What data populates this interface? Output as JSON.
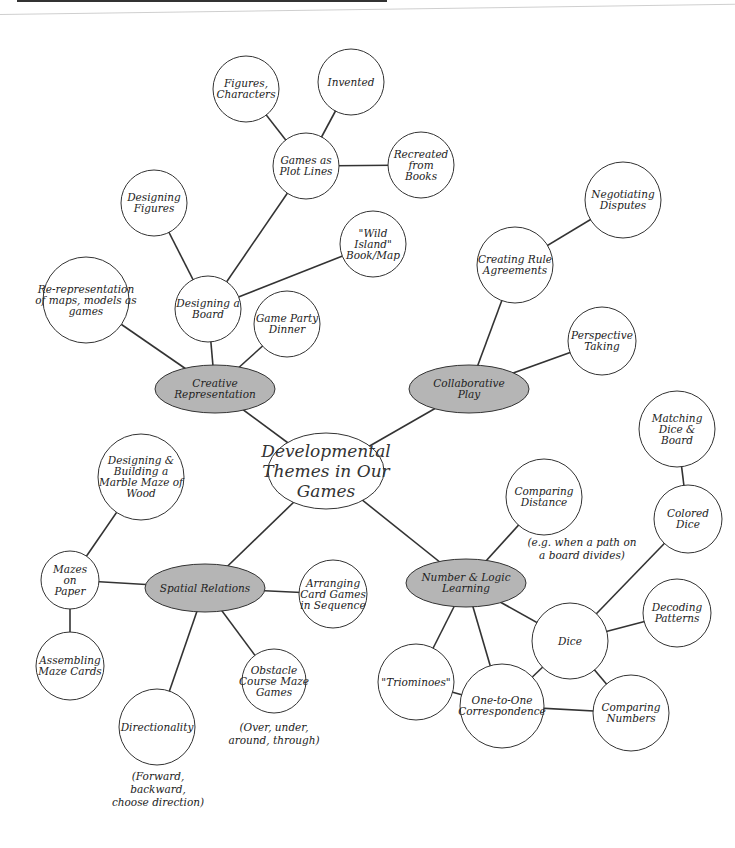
{
  "diagram": {
    "title": "Developmental Themes in Our Games",
    "colors": {
      "theme_fill": "#b5b5b5",
      "node_fill": "#ffffff",
      "stroke": "#333333"
    },
    "center": {
      "id": "center",
      "label": "Developmental\nThemes in Our\nGames",
      "x": 326,
      "y": 471,
      "rx": 58,
      "ry": 38
    },
    "themes": [
      {
        "id": "creative",
        "label": "Creative\nRepresentation",
        "x": 215,
        "y": 389,
        "rx": 60,
        "ry": 24
      },
      {
        "id": "collab",
        "label": "Collaborative\nPlay",
        "x": 469,
        "y": 389,
        "rx": 60,
        "ry": 24
      },
      {
        "id": "spatial",
        "label": "Spatial Relations",
        "x": 205,
        "y": 588,
        "rx": 60,
        "ry": 24
      },
      {
        "id": "number",
        "label": "Number & Logic\nLearning",
        "x": 466,
        "y": 583,
        "rx": 60,
        "ry": 24
      }
    ],
    "nodes": [
      {
        "id": "figures_characters",
        "label": "Figures,\nCharacters",
        "x": 246,
        "y": 89,
        "r": 33
      },
      {
        "id": "invented",
        "label": "Invented",
        "x": 351,
        "y": 82,
        "r": 33
      },
      {
        "id": "games_plot_lines",
        "label": "Games as\nPlot Lines",
        "x": 306,
        "y": 166,
        "r": 33
      },
      {
        "id": "recreated_books",
        "label": "Recreated\nfrom\nBooks",
        "x": 421,
        "y": 165,
        "r": 33
      },
      {
        "id": "designing_figures",
        "label": "Designing\nFigures",
        "x": 154,
        "y": 203,
        "r": 33
      },
      {
        "id": "wild_island",
        "label": "\"Wild\nIsland\"\nBook/Map",
        "x": 373,
        "y": 244,
        "r": 33
      },
      {
        "id": "re_representation",
        "label": "Re-representation\nof maps, models as\ngames",
        "x": 86,
        "y": 300,
        "r": 43
      },
      {
        "id": "designing_board",
        "label": "Designing a\nBoard",
        "x": 208,
        "y": 309,
        "r": 33
      },
      {
        "id": "game_party_dinner",
        "label": "Game Party\nDinner",
        "x": 287,
        "y": 324,
        "r": 33
      },
      {
        "id": "negotiating_disputes",
        "label": "Negotiating\nDisputes",
        "x": 623,
        "y": 200,
        "r": 38
      },
      {
        "id": "creating_rule_agreements",
        "label": "Creating Rule\nAgreements",
        "x": 515,
        "y": 265,
        "r": 38
      },
      {
        "id": "perspective_taking",
        "label": "Perspective\nTaking",
        "x": 602,
        "y": 341,
        "r": 34
      },
      {
        "id": "matching_dice_board",
        "label": "Matching\nDice &\nBoard",
        "x": 677,
        "y": 429,
        "r": 38
      },
      {
        "id": "colored_dice",
        "label": "Colored\nDice",
        "x": 688,
        "y": 519,
        "r": 34
      },
      {
        "id": "comparing_distance",
        "label": "Comparing\nDistance",
        "x": 544,
        "y": 497,
        "r": 38
      },
      {
        "id": "designing_building_maze",
        "label": "Designing &\nBuilding a\nMarble Maze of\nWood",
        "x": 141,
        "y": 477,
        "r": 43
      },
      {
        "id": "mazes_on_paper",
        "label": "Mazes\non\nPaper",
        "x": 70,
        "y": 580,
        "r": 29
      },
      {
        "id": "arranging_card_games",
        "label": "Arranging\nCard Games\nin Sequence",
        "x": 333,
        "y": 594,
        "r": 34
      },
      {
        "id": "assembling_maze_cards",
        "label": "Assembling\nMaze Cards",
        "x": 70,
        "y": 666,
        "r": 34
      },
      {
        "id": "obstacle_course",
        "label": "Obstacle\nCourse Maze\nGames",
        "x": 274,
        "y": 681,
        "r": 32
      },
      {
        "id": "directionality",
        "label": "Directionality",
        "x": 157,
        "y": 727,
        "r": 38
      },
      {
        "id": "triominoes",
        "label": "\"Triominoes\"",
        "x": 416,
        "y": 682,
        "r": 38
      },
      {
        "id": "dice",
        "label": "Dice",
        "x": 570,
        "y": 641,
        "r": 38
      },
      {
        "id": "decoding_patterns",
        "label": "Decoding\nPatterns",
        "x": 677,
        "y": 613,
        "r": 34
      },
      {
        "id": "one_to_one",
        "label": "One-to-One\nCorrespondence",
        "x": 502,
        "y": 706,
        "r": 42
      },
      {
        "id": "comparing_numbers",
        "label": "Comparing\nNumbers",
        "x": 631,
        "y": 713,
        "r": 38
      }
    ],
    "notes": [
      {
        "id": "note_distance",
        "text": "(e.g. when a path on\na board divides)",
        "x": 582,
        "y": 536
      },
      {
        "id": "note_obstacle",
        "text": "(Over, under,\naround, through)",
        "x": 274,
        "y": 721
      },
      {
        "id": "note_direction",
        "text": "(Forward,\nbackward,\nchoose direction)",
        "x": 158,
        "y": 770
      }
    ],
    "edges": [
      [
        "center",
        "creative"
      ],
      [
        "center",
        "collab"
      ],
      [
        "center",
        "spatial"
      ],
      [
        "center",
        "number"
      ],
      [
        "creative",
        "re_representation"
      ],
      [
        "creative",
        "designing_board"
      ],
      [
        "creative",
        "game_party_dinner"
      ],
      [
        "designing_board",
        "designing_figures"
      ],
      [
        "designing_board",
        "games_plot_lines"
      ],
      [
        "designing_board",
        "wild_island"
      ],
      [
        "games_plot_lines",
        "figures_characters"
      ],
      [
        "games_plot_lines",
        "invented"
      ],
      [
        "games_plot_lines",
        "recreated_books"
      ],
      [
        "collab",
        "creating_rule_agreements"
      ],
      [
        "collab",
        "perspective_taking"
      ],
      [
        "creating_rule_agreements",
        "negotiating_disputes"
      ],
      [
        "spatial",
        "mazes_on_paper"
      ],
      [
        "spatial",
        "arranging_card_games"
      ],
      [
        "spatial",
        "directionality"
      ],
      [
        "spatial",
        "obstacle_course"
      ],
      [
        "mazes_on_paper",
        "designing_building_maze"
      ],
      [
        "mazes_on_paper",
        "assembling_maze_cards"
      ],
      [
        "number",
        "comparing_distance"
      ],
      [
        "number",
        "triominoes"
      ],
      [
        "number",
        "one_to_one"
      ],
      [
        "number",
        "dice"
      ],
      [
        "dice",
        "colored_dice"
      ],
      [
        "dice",
        "decoding_patterns"
      ],
      [
        "dice",
        "comparing_numbers"
      ],
      [
        "dice",
        "one_to_one"
      ],
      [
        "colored_dice",
        "matching_dice_board"
      ],
      [
        "triominoes",
        "one_to_one"
      ],
      [
        "one_to_one",
        "comparing_numbers"
      ]
    ]
  }
}
